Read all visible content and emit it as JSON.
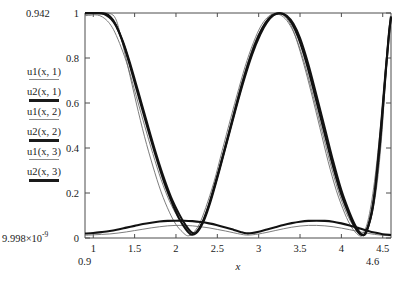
{
  "chart_data": {
    "type": "line",
    "title": "",
    "xlabel": "x",
    "ylabel": "",
    "grid": false,
    "legend_position": "left-outside",
    "xlim": [
      0.9,
      4.6
    ],
    "ylim": [
      9.998e-09,
      1
    ],
    "x_ticks": [
      "1",
      "1.5",
      "2",
      "2.5",
      "3",
      "3.5",
      "4",
      "4.5"
    ],
    "x_tick_values": [
      1,
      1.5,
      2,
      2.5,
      3,
      3.5,
      4,
      4.5
    ],
    "y_ticks": [
      "0",
      "0.2",
      "0.4",
      "0.6",
      "0.8",
      "1"
    ],
    "y_tick_values": [
      0,
      0.2,
      0.4,
      0.6,
      0.8,
      1
    ],
    "x_range_min_label": "0.9",
    "x_range_max_label": "4.6",
    "y_range_max_label": "0.942",
    "y_range_min_label": "9.998×10",
    "y_range_min_exponent": "-9",
    "series": [
      {
        "name": "u1(x, 1)",
        "style": "thin",
        "points": [
          [
            0.9,
            1.0
          ],
          [
            1.0,
            1.0
          ],
          [
            1.1,
            1.0
          ],
          [
            1.2,
            0.998
          ],
          [
            1.27,
            0.975
          ],
          [
            1.33,
            0.9
          ],
          [
            1.42,
            0.76
          ],
          [
            1.52,
            0.6
          ],
          [
            1.62,
            0.45
          ],
          [
            1.72,
            0.32
          ],
          [
            1.82,
            0.205
          ],
          [
            1.92,
            0.115
          ],
          [
            2.0,
            0.06
          ],
          [
            2.08,
            0.026
          ],
          [
            2.14,
            0.01
          ],
          [
            2.2,
            0.02
          ],
          [
            2.28,
            0.06
          ],
          [
            2.36,
            0.135
          ],
          [
            2.46,
            0.25
          ],
          [
            2.56,
            0.39
          ],
          [
            2.66,
            0.53
          ],
          [
            2.76,
            0.665
          ],
          [
            2.86,
            0.79
          ],
          [
            2.96,
            0.89
          ],
          [
            3.04,
            0.95
          ],
          [
            3.12,
            0.985
          ],
          [
            3.2,
            0.999
          ],
          [
            3.28,
            0.995
          ],
          [
            3.36,
            0.965
          ],
          [
            3.44,
            0.9
          ],
          [
            3.54,
            0.78
          ],
          [
            3.64,
            0.64
          ],
          [
            3.74,
            0.49
          ],
          [
            3.84,
            0.34
          ],
          [
            3.94,
            0.21
          ],
          [
            4.04,
            0.11
          ],
          [
            4.12,
            0.05
          ],
          [
            4.2,
            0.015
          ],
          [
            4.26,
            0.012
          ],
          [
            4.34,
            0.06
          ],
          [
            4.42,
            0.21
          ],
          [
            4.48,
            0.42
          ],
          [
            4.53,
            0.68
          ],
          [
            4.57,
            0.88
          ],
          [
            4.6,
            0.975
          ]
        ]
      },
      {
        "name": "u2(x, 1)",
        "style": "thick",
        "points": [
          [
            0.9,
            1.0
          ],
          [
            1.02,
            1.0
          ],
          [
            1.12,
            0.999
          ],
          [
            1.18,
            0.992
          ],
          [
            1.24,
            0.968
          ],
          [
            1.3,
            0.925
          ],
          [
            1.38,
            0.845
          ],
          [
            1.46,
            0.745
          ],
          [
            1.56,
            0.615
          ],
          [
            1.66,
            0.485
          ],
          [
            1.76,
            0.36
          ],
          [
            1.86,
            0.245
          ],
          [
            1.96,
            0.15
          ],
          [
            2.04,
            0.085
          ],
          [
            2.12,
            0.038
          ],
          [
            2.18,
            0.016
          ],
          [
            2.24,
            0.022
          ],
          [
            2.32,
            0.07
          ],
          [
            2.4,
            0.15
          ],
          [
            2.5,
            0.275
          ],
          [
            2.6,
            0.41
          ],
          [
            2.7,
            0.55
          ],
          [
            2.8,
            0.685
          ],
          [
            2.9,
            0.805
          ],
          [
            3.0,
            0.9
          ],
          [
            3.08,
            0.955
          ],
          [
            3.16,
            0.988
          ],
          [
            3.24,
            0.999
          ],
          [
            3.32,
            0.99
          ],
          [
            3.4,
            0.955
          ],
          [
            3.48,
            0.89
          ],
          [
            3.58,
            0.775
          ],
          [
            3.68,
            0.635
          ],
          [
            3.78,
            0.49
          ],
          [
            3.88,
            0.345
          ],
          [
            3.98,
            0.215
          ],
          [
            4.08,
            0.115
          ],
          [
            4.16,
            0.05
          ],
          [
            4.24,
            0.014
          ],
          [
            4.3,
            0.03
          ],
          [
            4.38,
            0.135
          ],
          [
            4.46,
            0.39
          ],
          [
            4.52,
            0.66
          ],
          [
            4.57,
            0.89
          ],
          [
            4.6,
            0.985
          ]
        ]
      },
      {
        "name": "u1(x, 2)",
        "style": "thin",
        "points": [
          [
            0.9,
            0.988
          ],
          [
            0.96,
            0.99
          ],
          [
            1.02,
            0.992
          ],
          [
            1.08,
            0.988
          ],
          [
            1.14,
            0.975
          ],
          [
            1.2,
            0.952
          ],
          [
            1.26,
            0.915
          ],
          [
            1.34,
            0.845
          ],
          [
            1.42,
            0.76
          ],
          [
            1.52,
            0.63
          ],
          [
            1.62,
            0.5
          ],
          [
            1.72,
            0.375
          ],
          [
            1.82,
            0.26
          ],
          [
            1.92,
            0.165
          ],
          [
            2.02,
            0.095
          ],
          [
            2.12,
            0.045
          ],
          [
            2.2,
            0.022
          ],
          [
            2.28,
            0.045
          ],
          [
            2.36,
            0.11
          ],
          [
            2.46,
            0.225
          ],
          [
            2.56,
            0.365
          ],
          [
            2.66,
            0.505
          ],
          [
            2.76,
            0.645
          ],
          [
            2.86,
            0.77
          ],
          [
            2.96,
            0.875
          ],
          [
            3.06,
            0.945
          ],
          [
            3.14,
            0.982
          ],
          [
            3.22,
            0.995
          ],
          [
            3.3,
            0.982
          ],
          [
            3.38,
            0.945
          ],
          [
            3.46,
            0.882
          ],
          [
            3.56,
            0.768
          ],
          [
            3.66,
            0.63
          ],
          [
            3.76,
            0.485
          ],
          [
            3.86,
            0.34
          ],
          [
            3.96,
            0.212
          ],
          [
            4.06,
            0.112
          ],
          [
            4.16,
            0.045
          ],
          [
            4.24,
            0.015
          ],
          [
            4.32,
            0.075
          ],
          [
            4.4,
            0.25
          ],
          [
            4.48,
            0.52
          ],
          [
            4.54,
            0.78
          ],
          [
            4.58,
            0.93
          ],
          [
            4.6,
            0.97
          ]
        ]
      },
      {
        "name": "u2(x, 2)",
        "style": "thick",
        "points": [
          [
            0.9,
            0.998
          ],
          [
            1.0,
            0.999
          ],
          [
            1.1,
            0.998
          ],
          [
            1.16,
            0.99
          ],
          [
            1.22,
            0.972
          ],
          [
            1.28,
            0.94
          ],
          [
            1.36,
            0.872
          ],
          [
            1.44,
            0.782
          ],
          [
            1.54,
            0.655
          ],
          [
            1.64,
            0.525
          ],
          [
            1.74,
            0.398
          ],
          [
            1.84,
            0.282
          ],
          [
            1.94,
            0.182
          ],
          [
            2.04,
            0.105
          ],
          [
            2.12,
            0.055
          ],
          [
            2.2,
            0.022
          ],
          [
            2.26,
            0.028
          ],
          [
            2.34,
            0.08
          ],
          [
            2.42,
            0.165
          ],
          [
            2.52,
            0.295
          ],
          [
            2.62,
            0.432
          ],
          [
            2.72,
            0.57
          ],
          [
            2.82,
            0.7
          ],
          [
            2.92,
            0.815
          ],
          [
            3.02,
            0.905
          ],
          [
            3.1,
            0.958
          ],
          [
            3.18,
            0.99
          ],
          [
            3.26,
            0.999
          ],
          [
            3.34,
            0.988
          ],
          [
            3.42,
            0.952
          ],
          [
            3.5,
            0.888
          ],
          [
            3.6,
            0.772
          ],
          [
            3.7,
            0.632
          ],
          [
            3.8,
            0.488
          ],
          [
            3.9,
            0.342
          ],
          [
            4.0,
            0.212
          ],
          [
            4.1,
            0.112
          ],
          [
            4.18,
            0.048
          ],
          [
            4.26,
            0.013
          ],
          [
            4.32,
            0.045
          ],
          [
            4.4,
            0.195
          ],
          [
            4.47,
            0.46
          ],
          [
            4.53,
            0.72
          ],
          [
            4.58,
            0.92
          ],
          [
            4.6,
            0.98
          ]
        ]
      },
      {
        "name": "u1(x, 3)",
        "style": "thin",
        "points": [
          [
            0.9,
            0.012
          ],
          [
            1.0,
            0.014
          ],
          [
            1.1,
            0.016
          ],
          [
            1.2,
            0.018
          ],
          [
            1.3,
            0.022
          ],
          [
            1.4,
            0.027
          ],
          [
            1.5,
            0.033
          ],
          [
            1.6,
            0.039
          ],
          [
            1.7,
            0.045
          ],
          [
            1.8,
            0.05
          ],
          [
            1.9,
            0.054
          ],
          [
            2.0,
            0.056
          ],
          [
            2.1,
            0.056
          ],
          [
            2.2,
            0.054
          ],
          [
            2.3,
            0.05
          ],
          [
            2.4,
            0.045
          ],
          [
            2.5,
            0.038
          ],
          [
            2.6,
            0.031
          ],
          [
            2.7,
            0.023
          ],
          [
            2.78,
            0.017
          ],
          [
            2.85,
            0.013
          ],
          [
            2.92,
            0.014
          ],
          [
            3.0,
            0.018
          ],
          [
            3.1,
            0.025
          ],
          [
            3.2,
            0.033
          ],
          [
            3.3,
            0.041
          ],
          [
            3.4,
            0.048
          ],
          [
            3.5,
            0.053
          ],
          [
            3.6,
            0.056
          ],
          [
            3.7,
            0.056
          ],
          [
            3.8,
            0.054
          ],
          [
            3.9,
            0.05
          ],
          [
            4.0,
            0.044
          ],
          [
            4.1,
            0.037
          ],
          [
            4.2,
            0.029
          ],
          [
            4.3,
            0.022
          ],
          [
            4.4,
            0.016
          ],
          [
            4.5,
            0.012
          ],
          [
            4.6,
            0.01
          ]
        ]
      },
      {
        "name": "u2(x, 3)",
        "style": "thick",
        "points": [
          [
            0.9,
            0.02
          ],
          [
            1.0,
            0.022
          ],
          [
            1.1,
            0.026
          ],
          [
            1.2,
            0.031
          ],
          [
            1.3,
            0.038
          ],
          [
            1.4,
            0.046
          ],
          [
            1.5,
            0.054
          ],
          [
            1.6,
            0.062
          ],
          [
            1.7,
            0.068
          ],
          [
            1.8,
            0.073
          ],
          [
            1.9,
            0.076
          ],
          [
            2.0,
            0.077
          ],
          [
            2.1,
            0.077
          ],
          [
            2.2,
            0.075
          ],
          [
            2.3,
            0.071
          ],
          [
            2.4,
            0.065
          ],
          [
            2.5,
            0.057
          ],
          [
            2.6,
            0.047
          ],
          [
            2.7,
            0.036
          ],
          [
            2.78,
            0.027
          ],
          [
            2.85,
            0.021
          ],
          [
            2.92,
            0.022
          ],
          [
            3.0,
            0.028
          ],
          [
            3.1,
            0.038
          ],
          [
            3.2,
            0.048
          ],
          [
            3.3,
            0.058
          ],
          [
            3.4,
            0.066
          ],
          [
            3.5,
            0.072
          ],
          [
            3.6,
            0.076
          ],
          [
            3.7,
            0.077
          ],
          [
            3.8,
            0.076
          ],
          [
            3.9,
            0.072
          ],
          [
            4.0,
            0.065
          ],
          [
            4.1,
            0.056
          ],
          [
            4.2,
            0.045
          ],
          [
            4.3,
            0.034
          ],
          [
            4.4,
            0.024
          ],
          [
            4.5,
            0.017
          ],
          [
            4.6,
            0.013
          ]
        ]
      }
    ]
  },
  "legend": {
    "entries": [
      {
        "label": "u1(x, 1)",
        "style": "thin"
      },
      {
        "label": "u2(x, 1)",
        "style": "thick"
      },
      {
        "label": "u1(x, 2)",
        "style": "thin"
      },
      {
        "label": "u2(x, 2)",
        "style": "thick"
      },
      {
        "label": "u1(x, 3)",
        "style": "thin"
      },
      {
        "label": "u2(x, 3)",
        "style": "thick"
      }
    ]
  }
}
